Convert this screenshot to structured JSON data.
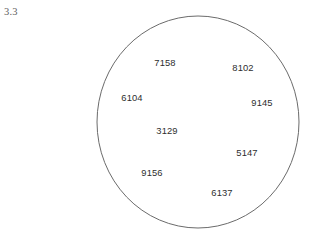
{
  "figure": {
    "label": "3.3",
    "background_color": "#ffffff"
  },
  "chart_data": {
    "type": "scatter",
    "title": "3.3",
    "xlabel": "",
    "ylabel": "",
    "grid": false,
    "legend": null,
    "shape": {
      "kind": "circle",
      "center_x": 198,
      "center_y": 122,
      "radius_x": 101,
      "radius_y": 106,
      "stroke_color": "#6b6b6b",
      "stroke_width": 1,
      "fill": "none"
    },
    "points": [
      {
        "label": "7158",
        "x": 165,
        "y": 62
      },
      {
        "label": "8102",
        "x": 243,
        "y": 67
      },
      {
        "label": "6104",
        "x": 132,
        "y": 97
      },
      {
        "label": "9145",
        "x": 262,
        "y": 102
      },
      {
        "label": "3129",
        "x": 167,
        "y": 130
      },
      {
        "label": "5147",
        "x": 247,
        "y": 152
      },
      {
        "label": "9156",
        "x": 152,
        "y": 172
      },
      {
        "label": "6137",
        "x": 222,
        "y": 192
      }
    ],
    "values": [
      7158,
      8102,
      6104,
      9145,
      3129,
      5147,
      9156,
      6137
    ],
    "text_color": "#2e2e2e"
  }
}
